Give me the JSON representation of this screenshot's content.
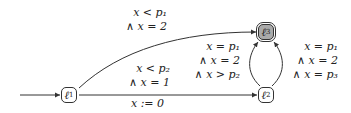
{
  "diagram": {
    "type": "parametric-timed-automaton",
    "states": [
      {
        "id": "l1",
        "label": "ℓ",
        "sub": "1",
        "initial": true,
        "final": false
      },
      {
        "id": "l2",
        "label": "ℓ",
        "sub": "2",
        "initial": false,
        "final": false
      },
      {
        "id": "l3",
        "label": "ℓ",
        "sub": "3",
        "initial": false,
        "final": true
      }
    ],
    "edges": [
      {
        "from": "l1",
        "to": "l3",
        "guard": [
          "x < p₁",
          "∧ x = 2"
        ],
        "reset": ""
      },
      {
        "from": "l1",
        "to": "l2",
        "guard": [
          "x < p₂",
          "∧ x = 1"
        ],
        "reset": "x := 0"
      },
      {
        "from": "l2",
        "to": "l3",
        "side": "left",
        "guard": [
          "x = p₁",
          "∧ x = 2",
          "∧ x > p₂"
        ],
        "reset": ""
      },
      {
        "from": "l2",
        "to": "l3",
        "side": "right",
        "guard": [
          "x = p₁",
          "∧ x = 2",
          "∧ x = p₃"
        ],
        "reset": ""
      }
    ],
    "colors": {
      "final_fill": "#aaaaaa",
      "stroke": "#333333"
    }
  }
}
